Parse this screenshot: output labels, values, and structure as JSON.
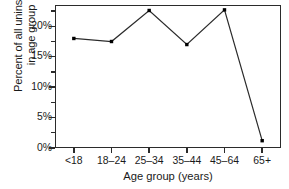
{
  "chart_data": {
    "type": "line",
    "title": "",
    "subtitle": "",
    "xlabel": "Age group (years)",
    "ylabel": "Percent of all uninsured in age group",
    "ylabel_line1": "Percent of all uninsured",
    "ylabel_line2": "in age group",
    "categories": [
      "<18",
      "18–24",
      "25–34",
      "35–44",
      "45–64",
      "65+"
    ],
    "values": [
      18.0,
      17.5,
      22.6,
      17.0,
      22.7,
      1.2
    ],
    "series": [
      {
        "name": "Percent of all uninsured in age group",
        "values": [
          18.0,
          17.5,
          22.6,
          17.0,
          22.7,
          1.2
        ]
      }
    ],
    "ylim": [
      0,
      23.5
    ],
    "xlim_categories": 6,
    "y_ticks": [
      0,
      5,
      10,
      15,
      20
    ],
    "y_tick_labels": [
      "0%",
      "5%",
      "10%",
      "15%",
      "20%"
    ],
    "y_minor_ticks": [
      2.5,
      7.5,
      12.5,
      17.5,
      22.5
    ],
    "grid": false,
    "legend": false,
    "legend_position": "none",
    "marker": "square-filled",
    "line_color": "#2b2b2b",
    "marker_color": "#000000",
    "frame_color": "#2b2b2b",
    "background_color": "#ffffff",
    "annotations": []
  }
}
